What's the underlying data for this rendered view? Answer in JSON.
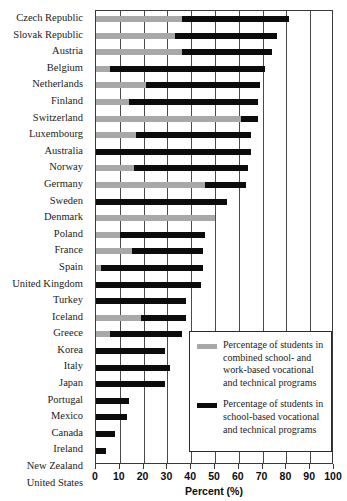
{
  "chart_data": {
    "type": "bar",
    "orientation": "horizontal",
    "stacked": true,
    "title": "",
    "xlabel": "Percent (%)",
    "ylabel": "",
    "xlim": [
      0,
      100
    ],
    "xticks": [
      0,
      10,
      20,
      30,
      40,
      50,
      60,
      70,
      80,
      90,
      100
    ],
    "grid": true,
    "grid_axis": "x",
    "legend_position": "inside-lower-right",
    "categories": [
      "Czech Republic",
      "Slovak Republic",
      "Austria",
      "Belgium",
      "Netherlands",
      "Finland",
      "Switzerland",
      "Luxembourg",
      "Australia",
      "Norway",
      "Germany",
      "Sweden",
      "Denmark",
      "Poland",
      "France",
      "Spain",
      "United Kingdom",
      "Turkey",
      "Iceland",
      "Greece",
      "Korea",
      "Italy",
      "Japan",
      "Portugal",
      "Mexico",
      "Canada",
      "Ireland",
      "New Zealand",
      "United States"
    ],
    "series": [
      {
        "name": "Percentage of students in combined school- and work-based vocational and technical programs",
        "short_name": "combined school- and work-based",
        "color": "#a8a8a8",
        "values": [
          36,
          33,
          36,
          6,
          21,
          14,
          61,
          17,
          0,
          16,
          46,
          0,
          50,
          10,
          15,
          2,
          0,
          0,
          19,
          6,
          0,
          0,
          0,
          0,
          0,
          0,
          0,
          0,
          0
        ]
      },
      {
        "name": "Percentage of students in school-based vocational and technical programs",
        "short_name": "school-based",
        "color": "#0c0c0c",
        "values": [
          45,
          43,
          38,
          65,
          48,
          54,
          7,
          48,
          65,
          48,
          17,
          55,
          0,
          36,
          30,
          43,
          44,
          38,
          19,
          30,
          29,
          31,
          29,
          14,
          13,
          8,
          4,
          0,
          0
        ]
      }
    ],
    "totals": [
      81,
      76,
      74,
      71,
      69,
      68,
      68,
      65,
      65,
      64,
      63,
      55,
      50,
      46,
      45,
      45,
      44,
      38,
      38,
      36,
      29,
      31,
      29,
      14,
      13,
      8,
      4,
      0,
      0
    ]
  },
  "legend": {
    "items": [
      {
        "swatch": "gray",
        "label": "Percentage of students in combined school- and work-based vocational and technical programs"
      },
      {
        "swatch": "black",
        "label": "Percentage of students in school-based vocational and technical programs"
      }
    ]
  }
}
